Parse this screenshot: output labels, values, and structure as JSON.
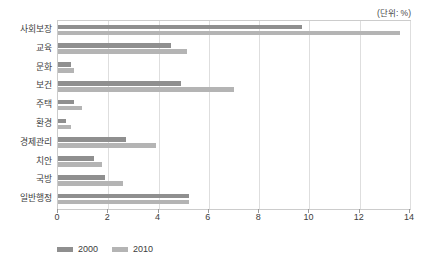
{
  "unit_note": "(단위: %)",
  "legend": {
    "position": "bottom-left",
    "items": [
      {
        "label": "2000",
        "color": "#8f8f8f"
      },
      {
        "label": "2010",
        "color": "#b4b4b4"
      }
    ]
  },
  "axis": {
    "x_ticks": [
      "0",
      "2",
      "4",
      "6",
      "8",
      "10",
      "12",
      "14"
    ],
    "x_min": 0,
    "x_max": 14
  },
  "chart_data": {
    "type": "bar",
    "orientation": "horizontal",
    "title": "",
    "subtitle": "",
    "xlabel": "",
    "ylabel": "",
    "unit": "%",
    "xlim": [
      0,
      14
    ],
    "xticks": [
      0,
      2,
      4,
      6,
      8,
      10,
      12,
      14
    ],
    "grid": "vertical",
    "legend_position": "bottom-left",
    "categories": [
      "사회보장",
      "교육",
      "문화",
      "보건",
      "주택",
      "환경",
      "경제관리",
      "치안",
      "국방",
      "일반행정"
    ],
    "series": [
      {
        "name": "2000",
        "color": "#8f8f8f",
        "values": [
          9.7,
          4.5,
          0.5,
          4.9,
          0.65,
          0.3,
          2.7,
          1.45,
          1.85,
          5.2
        ]
      },
      {
        "name": "2010",
        "color": "#b4b4b4",
        "values": [
          13.6,
          5.15,
          0.65,
          7.0,
          0.95,
          0.5,
          3.9,
          1.75,
          2.6,
          5.2
        ]
      }
    ]
  }
}
